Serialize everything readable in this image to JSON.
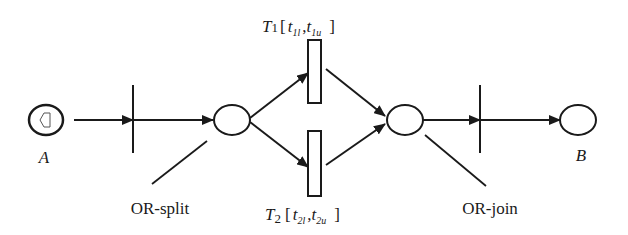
{
  "diagram": {
    "type": "petri-net",
    "places": [
      {
        "id": "A",
        "label": "A",
        "has_token_icon": true
      },
      {
        "id": "or_split_place",
        "label": ""
      },
      {
        "id": "or_join_place",
        "label": ""
      },
      {
        "id": "B",
        "label": "B"
      }
    ],
    "transitions": [
      {
        "id": "t_in",
        "kind": "bar"
      },
      {
        "id": "T1",
        "kind": "box",
        "name": "T",
        "sub": "1",
        "interval": {
          "lower": "t",
          "lower_sub": "1l",
          "upper": "t",
          "upper_sub": "1u"
        }
      },
      {
        "id": "T2",
        "kind": "box",
        "name": "T",
        "sub": "2",
        "interval": {
          "lower": "t",
          "lower_sub": "2l",
          "upper": "t",
          "upper_sub": "2u"
        }
      },
      {
        "id": "t_out",
        "kind": "bar"
      }
    ],
    "annotations": {
      "or_split": "OR-split",
      "or_join": "OR-join"
    },
    "colors": {
      "stroke": "#1a1a1a",
      "background": "#ffffff"
    }
  }
}
